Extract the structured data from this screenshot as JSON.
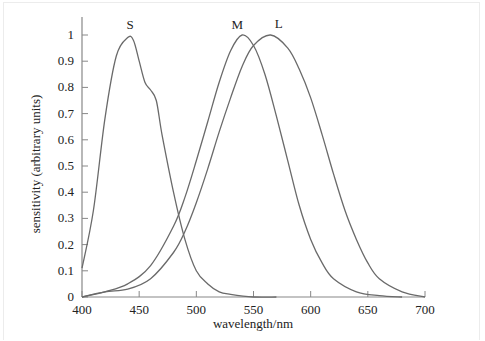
{
  "chart_data": {
    "type": "line",
    "title": "",
    "xlabel": "wavelength/nm",
    "ylabel": "sensitivity (arbitrary units)",
    "xlim": [
      400,
      700
    ],
    "ylim": [
      0,
      1
    ],
    "grid": false,
    "legend": "inline curve labels at peaks",
    "x_ticks": [
      400,
      450,
      500,
      550,
      600,
      650,
      700
    ],
    "y_ticks": [
      0,
      0.1,
      0.2,
      0.3,
      0.4,
      0.5,
      0.6,
      0.7,
      0.8,
      0.9,
      1
    ],
    "y_tick_labels": [
      "0",
      "0.1",
      "0.2",
      "0.3",
      "0.4",
      "0.5",
      "0.6",
      "0.7",
      "0.8",
      "0.9",
      "1"
    ],
    "series": [
      {
        "name": "S",
        "peak_nm": 442,
        "x": [
          400,
          410,
          420,
          430,
          440,
          445,
          450,
          455,
          460,
          465,
          470,
          480,
          490,
          500,
          510,
          520,
          530,
          550,
          570
        ],
        "values": [
          0.11,
          0.33,
          0.68,
          0.92,
          0.99,
          0.98,
          0.9,
          0.82,
          0.79,
          0.75,
          0.62,
          0.4,
          0.22,
          0.1,
          0.05,
          0.02,
          0.01,
          0.0,
          0.0
        ]
      },
      {
        "name": "M",
        "peak_nm": 541,
        "x": [
          400,
          420,
          440,
          460,
          480,
          490,
          500,
          510,
          520,
          530,
          540,
          550,
          560,
          570,
          580,
          590,
          600,
          610,
          620,
          640,
          660,
          680
        ],
        "values": [
          0.0,
          0.02,
          0.05,
          0.12,
          0.27,
          0.38,
          0.52,
          0.67,
          0.82,
          0.94,
          1.0,
          0.96,
          0.85,
          0.69,
          0.52,
          0.35,
          0.22,
          0.13,
          0.07,
          0.02,
          0.005,
          0.0
        ]
      },
      {
        "name": "L",
        "peak_nm": 565,
        "x": [
          400,
          420,
          440,
          460,
          480,
          490,
          500,
          510,
          520,
          530,
          540,
          550,
          565,
          580,
          590,
          600,
          610,
          620,
          630,
          640,
          650,
          660,
          680,
          700
        ],
        "values": [
          0.0,
          0.02,
          0.03,
          0.07,
          0.17,
          0.25,
          0.36,
          0.49,
          0.63,
          0.76,
          0.88,
          0.96,
          1.0,
          0.95,
          0.87,
          0.76,
          0.62,
          0.47,
          0.33,
          0.22,
          0.13,
          0.07,
          0.02,
          0.0
        ]
      }
    ]
  },
  "colors": {
    "curve": "#6a6a6a",
    "axis": "#888888",
    "text": "#222222",
    "background": "#ffffff"
  }
}
